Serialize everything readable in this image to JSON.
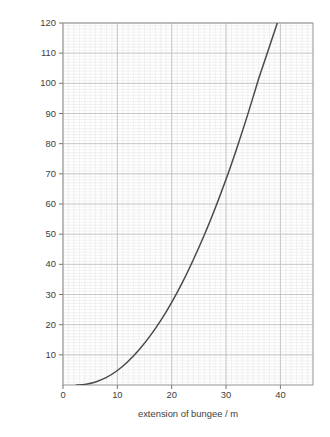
{
  "chart_data": {
    "type": "line",
    "title": "",
    "subtitle": "",
    "xlabel": "extension of bungee / m",
    "ylabel": "elastic potential energy in the bungee rope / kJ",
    "xlim": [
      0,
      46
    ],
    "ylim": [
      0,
      120
    ],
    "x_major_ticks": [
      0,
      10,
      20,
      30,
      40
    ],
    "x_tick_labels": [
      "0",
      "10",
      "20",
      "30",
      "40"
    ],
    "y_major_ticks": [
      10,
      20,
      30,
      40,
      50,
      60,
      70,
      80,
      90,
      100,
      110,
      120
    ],
    "y_tick_labels": [
      "10",
      "20",
      "30",
      "40",
      "50",
      "60",
      "70",
      "80",
      "90",
      "100",
      "110",
      "120"
    ],
    "x_minor_step": 1,
    "y_minor_step": 1,
    "grid": true,
    "grid_minor": true,
    "legend": null,
    "legend_position": "none",
    "series": [
      {
        "name": "elastic potential energy",
        "color": "#4a4a4a",
        "x": [
          2.5,
          4,
          6,
          8,
          10,
          12,
          14,
          16,
          18,
          20,
          22,
          24,
          26,
          28,
          30,
          32,
          34,
          36,
          37.3
        ],
        "values": [
          0,
          0.2,
          1.0,
          2.5,
          4.8,
          7.9,
          11.7,
          16.2,
          21.4,
          27.4,
          34.1,
          41.6,
          49.7,
          58.6,
          68.2,
          78.6,
          89.7,
          101.5,
          108.5
        ]
      }
    ],
    "annotations": [],
    "colors": {
      "curve": "#4a4a4a",
      "axis": "#6e6e6e",
      "grid_major": "#bdbdbd",
      "grid_minor": "#e8e8e8",
      "background": "#ffffff",
      "text": "#3d3d3d"
    },
    "plot_box": {
      "left": 63,
      "top": 23,
      "right": 313,
      "bottom": 385
    }
  }
}
